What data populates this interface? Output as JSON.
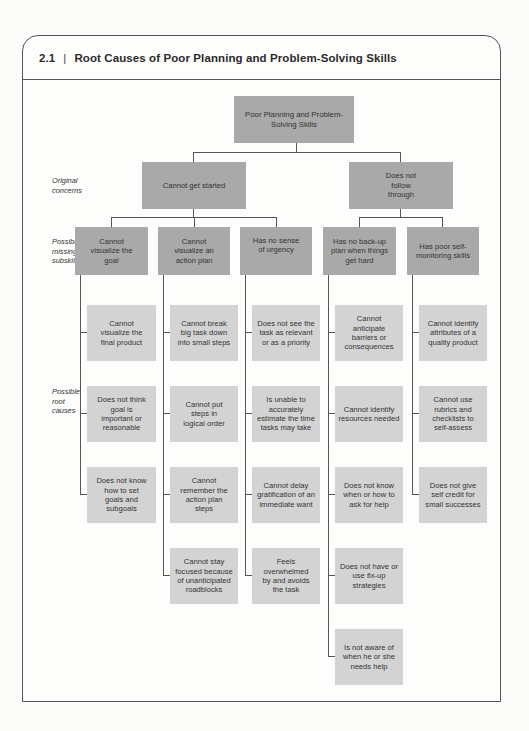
{
  "header": {
    "number": "2.1",
    "separator": "|",
    "title": "Root Causes of Poor Planning and Problem-Solving Skills"
  },
  "side_labels": {
    "original_concerns": [
      "Original",
      "concerns"
    ],
    "missing_subskills": [
      "Possible",
      "missing",
      "subskills"
    ],
    "root_causes": [
      "Possible",
      "root",
      "causes"
    ]
  },
  "tree": {
    "root": "Poor Planning and Problem-Solving Skills",
    "concerns": [
      {
        "label": "Cannot get started",
        "subskills": [
          {
            "label": "Cannot visualize the goal",
            "causes": [
              "Cannot visualize the final product",
              "Does not think goal is important or reasonable",
              "Does not know how to set goals and subgoals"
            ]
          },
          {
            "label": "Cannot visualize an action plan",
            "causes": [
              "Cannot break big task down into small steps",
              "Cannot put steps in logical order",
              "Cannot remember the action plan steps",
              "Cannot stay focused because of unanticipated roadblocks"
            ]
          },
          {
            "label": "Has no sense of urgency",
            "causes": [
              "Does not see the task as relevant or as a priority",
              "Is unable to accurately estimate the time tasks may take",
              "Cannot delay gratification of an immediate want",
              "Feels overwhelmed by and avoids the task"
            ]
          }
        ]
      },
      {
        "label": "Does not follow through",
        "subskills": [
          {
            "label": "Has no back-up plan when things get hard",
            "causes": [
              "Cannot anticipate barriers or consequences",
              "Cannot identify resources needed",
              "Does not know when or how to ask for help",
              "Does not have or use fix-up strategies",
              "Is not aware of when he or she needs help"
            ]
          },
          {
            "label": "Has poor self-monitoring skills",
            "causes": [
              "Cannot identify attributes of a quality product",
              "Cannot use rubrics and checklists to self-assess",
              "Does not give self credit for small successes"
            ]
          }
        ]
      }
    ]
  },
  "colors": {
    "dark_box": "#a9a9a9",
    "light_box": "#d3d3d3",
    "line": "#555555"
  }
}
